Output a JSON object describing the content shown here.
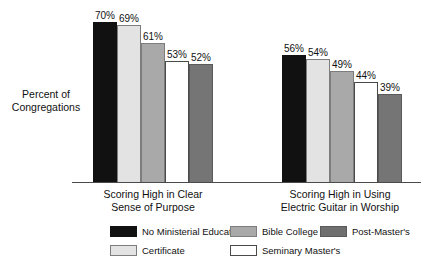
{
  "chart_data": {
    "type": "bar",
    "title": "",
    "subtitle": "",
    "xlabel": "",
    "ylabel": "Percent of Congregations",
    "ylabel_lines": [
      "Percent of",
      "Congregations"
    ],
    "ylim": [
      0,
      75
    ],
    "grid": false,
    "value_suffix": "%",
    "legend_position": "bottom",
    "categories": [
      "Scoring High in Clear Sense of Purpose",
      "Scoring High in Using Electric Guitar in Worship"
    ],
    "category_lines": [
      [
        "Scoring High in Clear",
        "Sense of Purpose"
      ],
      [
        "Scoring High in Using",
        "Electric Guitar in Worship"
      ]
    ],
    "series": [
      {
        "name": "No Ministerial Education",
        "swatch": "dark",
        "color": "#111111",
        "values": [
          70,
          56
        ],
        "labels": [
          "70%",
          "56%"
        ]
      },
      {
        "name": "Certificate",
        "swatch": "light",
        "color": "#e3e3e3",
        "values": [
          69,
          54
        ],
        "labels": [
          "69%",
          "54%"
        ]
      },
      {
        "name": "Bible College",
        "swatch": "mid",
        "color": "#a9a9a9",
        "values": [
          61,
          49
        ],
        "labels": [
          "61%",
          "49%"
        ]
      },
      {
        "name": "Seminary Master's",
        "swatch": "white",
        "color": "#ffffff",
        "values": [
          53,
          44
        ],
        "labels": [
          "53%",
          "44%"
        ]
      },
      {
        "name": "Post-Master's",
        "swatch": "dgray",
        "color": "#757575",
        "values": [
          52,
          39
        ],
        "labels": [
          "52%",
          "39%"
        ]
      }
    ],
    "legend_layout": [
      [
        {
          "series_index": 0,
          "label": "No Ministerial Education",
          "swatch": "dark"
        },
        {
          "series_index": 2,
          "label": "Bible College",
          "swatch": "mid"
        },
        {
          "series_index": 4,
          "label": "Post-Master's",
          "swatch": "dgray"
        }
      ],
      [
        {
          "series_index": 1,
          "label": "Certificate",
          "swatch": "light"
        },
        {
          "series_index": 3,
          "label": "Seminary Master's",
          "swatch": "white"
        }
      ]
    ]
  }
}
